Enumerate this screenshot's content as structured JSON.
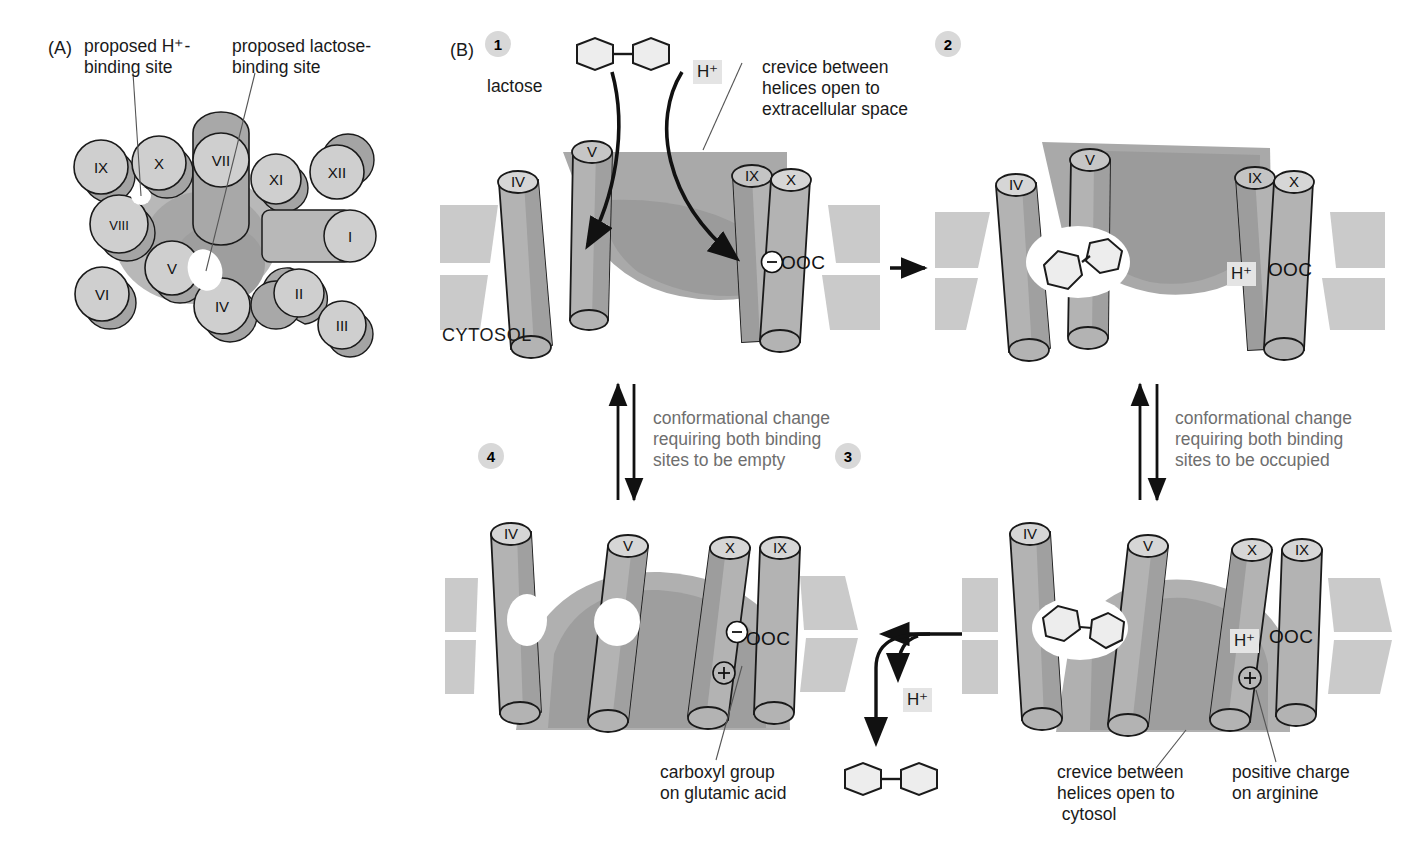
{
  "figure": {
    "panels": [
      "A",
      "B"
    ]
  },
  "panel_a": {
    "tag": "(A)",
    "callouts": [
      {
        "name": "h-binding-site",
        "text": "proposed H⁺-\nbinding site"
      },
      {
        "name": "lactose-binding-site",
        "text": "proposed lactose-\nbinding site"
      }
    ],
    "helices": [
      {
        "label": "IX",
        "x": 101,
        "y": 167,
        "r": 27,
        "shape": "circle"
      },
      {
        "label": "X",
        "x": 159,
        "y": 163,
        "r": 27,
        "shape": "circle"
      },
      {
        "label": "VII",
        "x": 221,
        "y": 160,
        "r": 28,
        "shape": "capsule-v"
      },
      {
        "label": "XI",
        "x": 276,
        "y": 179,
        "r": 25,
        "shape": "circle"
      },
      {
        "label": "XII",
        "x": 337,
        "y": 172,
        "r": 27,
        "shape": "circle"
      },
      {
        "label": "VIII",
        "x": 119,
        "y": 224,
        "r": 29,
        "shape": "circle"
      },
      {
        "label": "I",
        "x": 350,
        "y": 236,
        "r": 26,
        "shape": "capsule-h"
      },
      {
        "label": "V",
        "x": 172,
        "y": 268,
        "r": 27,
        "shape": "circle"
      },
      {
        "label": "VI",
        "x": 102,
        "y": 294,
        "r": 27,
        "shape": "circle"
      },
      {
        "label": "IV",
        "x": 222,
        "y": 306,
        "r": 28,
        "shape": "circle"
      },
      {
        "label": "II",
        "x": 299,
        "y": 293,
        "r": 25,
        "shape": "capsule-d"
      },
      {
        "label": "III",
        "x": 342,
        "y": 325,
        "r": 24,
        "shape": "circle"
      }
    ]
  },
  "panel_b": {
    "tag": "(B)",
    "steps": [
      {
        "number": "1",
        "helices": [
          "IV",
          "V",
          "IX",
          "X"
        ],
        "charge_label": "OOC",
        "charge_sign": "⊖",
        "cytosol_label": "CYTOSOL",
        "annotations": [
          {
            "name": "lactose-label",
            "text": "lactose"
          },
          {
            "name": "proton-label",
            "text": "H⁺"
          },
          {
            "name": "crevice-label",
            "text": "crevice between\nhelices open to\nextracellular space"
          }
        ]
      },
      {
        "number": "2",
        "helices": [
          "IV",
          "V",
          "IX",
          "X"
        ],
        "charge_label": "OOC",
        "charge_sign": "H⁺",
        "annotations": []
      },
      {
        "number": "3",
        "helices": [
          "IV",
          "V",
          "X",
          "IX"
        ],
        "charge_label": "OOC",
        "charge_sign": "H⁺",
        "positive_charge": "+",
        "annotations": [
          {
            "name": "crevice-cytosol-label",
            "text": "crevice between\nhelices open to\n cytosol"
          },
          {
            "name": "arginine-label",
            "text": "positive charge\non arginine"
          }
        ]
      },
      {
        "number": "4",
        "helices": [
          "IV",
          "V",
          "X",
          "IX"
        ],
        "charge_label": "OOC",
        "charge_sign": "⊖",
        "positive_charge": "+",
        "annotations": [
          {
            "name": "carboxyl-label",
            "text": "carboxyl group\non glutamic acid"
          }
        ]
      }
    ],
    "transitions": [
      {
        "name": "transition-1-to-2",
        "text": "",
        "direction": "right"
      },
      {
        "name": "transition-2-to-3",
        "text": "conformational change\nrequiring both binding\nsites to be occupied",
        "direction": "vertical"
      },
      {
        "name": "transition-3-to-4",
        "text": "",
        "direction": "left",
        "released": [
          "H⁺",
          "lactose"
        ]
      },
      {
        "name": "transition-4-to-1",
        "text": "conformational change\nrequiring both binding\nsites to be empty",
        "direction": "vertical"
      }
    ],
    "released_proton_label": "H⁺"
  },
  "colors": {
    "helix_body": "#b3b3b3",
    "helix_top": "#d6d6d6",
    "helix_shadow": "#9a9a9a",
    "membrane": "#c9c9c9",
    "crevice": "#a8a8a8",
    "crevice_dark": "#989898",
    "outline": "#1a1a1a",
    "badge": "#d8d8d8",
    "gray_text": "#6e6e6e",
    "lactose_fill": "#ebebeb"
  }
}
